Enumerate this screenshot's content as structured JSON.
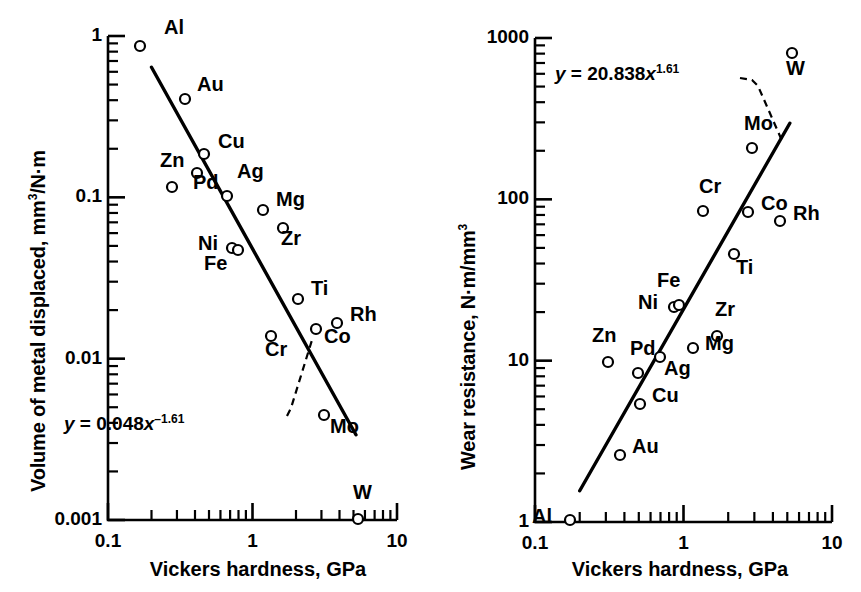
{
  "figure": {
    "panels": [
      {
        "id": "left",
        "xlabel": "Vickers hardness, GPa",
        "ylabel_main": "Volume of metal displaced, mm",
        "ylabel_sup": "3",
        "ylabel_tail": "/N·m",
        "equation_pre": "y",
        "equation_eq": " = 0.048",
        "equation_x": "x",
        "equation_exp": "–1.61",
        "xticks": [
          "0.1",
          "1",
          "10"
        ],
        "yticks": [
          "1",
          "0.1",
          "0.01",
          "0.001"
        ]
      },
      {
        "id": "right",
        "xlabel": "Vickers hardness, GPa",
        "ylabel_main": "Wear resistance, N·m/mm",
        "ylabel_sup": "3",
        "ylabel_tail": "",
        "equation_pre": "y",
        "equation_eq": " = 20.838",
        "equation_x": "x",
        "equation_exp": "1.61",
        "xticks": [
          "0.1",
          "1",
          "10"
        ],
        "yticks": [
          "1000",
          "100",
          "10",
          "1"
        ]
      }
    ]
  },
  "chart_data": [
    {
      "type": "scatter",
      "panel": "left",
      "title": "",
      "xlabel": "Vickers hardness, GPa",
      "ylabel": "Volume of metal displaced, mm3/N·m",
      "xscale": "log",
      "yscale": "log",
      "xlim": [
        0.1,
        10
      ],
      "ylim": [
        0.001,
        1
      ],
      "grid": false,
      "legend": "none",
      "annotation": "y = 0.048x^-1.61",
      "fit": {
        "coefficient": 0.048,
        "exponent": -1.61,
        "x_start": 0.2,
        "x_end": 5.2
      },
      "point_labels": [
        "Al",
        "Au",
        "Cu",
        "Zn",
        "Pd",
        "Ag",
        "Mg",
        "Zr",
        "Ni",
        "Fe",
        "Ti",
        "Cr",
        "Co",
        "Rh",
        "Mo",
        "W"
      ],
      "x": [
        0.22,
        0.42,
        0.6,
        0.33,
        0.54,
        0.76,
        1.1,
        1.5,
        0.84,
        0.88,
        1.8,
        1.5,
        2.7,
        4.0,
        3.0,
        5.0
      ],
      "y": [
        0.8,
        0.35,
        0.19,
        0.105,
        0.135,
        0.1,
        0.075,
        0.055,
        0.05,
        0.048,
        0.022,
        0.013,
        0.0135,
        0.015,
        0.0045,
        0.001
      ]
    },
    {
      "type": "scatter",
      "panel": "right",
      "title": "",
      "xlabel": "Vickers hardness, GPa",
      "ylabel": "Wear resistance, N·m/mm3",
      "xscale": "log",
      "yscale": "log",
      "xlim": [
        0.1,
        10
      ],
      "ylim": [
        1,
        1000
      ],
      "grid": false,
      "legend": "none",
      "annotation": "y = 20.838x^1.61",
      "fit": {
        "coefficient": 20.838,
        "exponent": 1.61,
        "x_start": 0.2,
        "x_end": 5.2
      },
      "point_labels": [
        "Al",
        "Au",
        "Cu",
        "Zn",
        "Pd",
        "Ag",
        "Mg",
        "Zr",
        "Ni",
        "Fe",
        "Ti",
        "Cr",
        "Co",
        "Rh",
        "Mo",
        "W"
      ],
      "x": [
        0.2,
        0.42,
        0.6,
        0.33,
        0.54,
        0.8,
        1.1,
        1.55,
        0.82,
        0.86,
        1.8,
        1.4,
        2.6,
        3.8,
        2.9,
        5.0
      ],
      "y": [
        1.0,
        2.7,
        5.0,
        9.3,
        8.2,
        10.0,
        11.5,
        14.0,
        20.0,
        21.0,
        45.0,
        77.0,
        75.0,
        62.0,
        205.0,
        600.0
      ]
    }
  ],
  "markers": {
    "left": [
      {
        "label": "Al",
        "lx": 24,
        "ly": -20,
        "mx": 140,
        "my": 46
      },
      {
        "label": "Au",
        "lx": 12,
        "ly": -16,
        "mx": 185,
        "my": 99
      },
      {
        "label": "Cu",
        "lx": 14,
        "ly": -14,
        "mx": 204,
        "my": 154
      },
      {
        "label": "Zn",
        "lx": -12,
        "ly": -28,
        "mx": 172,
        "my": 187
      },
      {
        "label": "Pd",
        "lx": -4,
        "ly": 8,
        "mx": 197,
        "my": 173
      },
      {
        "label": "Ag",
        "lx": 10,
        "ly": -26,
        "mx": 227,
        "my": 196
      },
      {
        "label": "Mg",
        "lx": 13,
        "ly": -12,
        "mx": 263,
        "my": 210
      },
      {
        "label": "Zr",
        "lx": -2,
        "ly": 9,
        "mx": 283,
        "my": 228
      },
      {
        "label": "Ni",
        "lx": -34,
        "ly": -6,
        "mx": 232,
        "my": 248
      },
      {
        "label": "Fe",
        "lx": -34,
        "ly": 12,
        "mx": 238,
        "my": 250
      },
      {
        "label": "Ti",
        "lx": 13,
        "ly": -12,
        "mx": 298,
        "my": 299
      },
      {
        "label": "Cr",
        "lx": -6,
        "ly": 12,
        "mx": 271,
        "my": 336
      },
      {
        "label": "Co",
        "lx": 8,
        "ly": 6,
        "mx": 316,
        "my": 329
      },
      {
        "label": "Rh",
        "lx": 13,
        "ly": -10,
        "mx": 337,
        "my": 323
      },
      {
        "label": "Mo",
        "lx": 6,
        "ly": 10,
        "mx": 324,
        "my": 415
      },
      {
        "label": "W",
        "lx": -5,
        "ly": -28,
        "mx": 358,
        "my": 519
      }
    ],
    "right": [
      {
        "label": "Al",
        "lx": -38,
        "ly": -5,
        "mx": 570,
        "my": 520
      },
      {
        "label": "Au",
        "lx": 12,
        "ly": -10,
        "mx": 620,
        "my": 455
      },
      {
        "label": "Cu",
        "lx": 12,
        "ly": -10,
        "mx": 640,
        "my": 404
      },
      {
        "label": "Zn",
        "lx": -16,
        "ly": -28,
        "mx": 608,
        "my": 362
      },
      {
        "label": "Pd",
        "lx": -8,
        "ly": -26,
        "mx": 638,
        "my": 373
      },
      {
        "label": "Ag",
        "lx": 4,
        "ly": 10,
        "mx": 660,
        "my": 357
      },
      {
        "label": "Mg",
        "lx": 12,
        "ly": -6,
        "mx": 693,
        "my": 348
      },
      {
        "label": "Zr",
        "lx": -2,
        "ly": -28,
        "mx": 717,
        "my": 336
      },
      {
        "label": "Ni",
        "lx": -36,
        "ly": -6,
        "mx": 674,
        "my": 307
      },
      {
        "label": "Fe",
        "lx": -22,
        "ly": -26,
        "mx": 679,
        "my": 305
      },
      {
        "label": "Ti",
        "lx": 2,
        "ly": 12,
        "mx": 734,
        "my": 254
      },
      {
        "label": "Cr",
        "lx": -4,
        "ly": -26,
        "mx": 703,
        "my": 211
      },
      {
        "label": "Co",
        "lx": 13,
        "ly": -10,
        "mx": 748,
        "my": 212
      },
      {
        "label": "Rh",
        "lx": 13,
        "ly": -9,
        "mx": 780,
        "my": 221
      },
      {
        "label": "Mo",
        "lx": -8,
        "ly": -26,
        "mx": 752,
        "my": 148
      },
      {
        "label": "W",
        "lx": -6,
        "ly": 14,
        "mx": 792,
        "my": 53
      }
    ]
  }
}
